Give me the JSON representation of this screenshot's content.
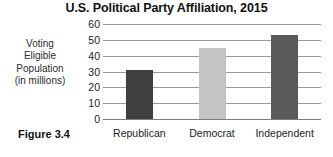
{
  "figure": {
    "caption": "Figure 3.4"
  },
  "chart_data": {
    "type": "bar",
    "title": "U.S. Political Party Affiliation, 2015",
    "xlabel": "",
    "ylabel": "Voting Eligible Population (in millions)",
    "ylabel_lines": [
      "Voting",
      "Eligible",
      "Population",
      "(in millions)"
    ],
    "categories": [
      "Republican",
      "Democrat",
      "Independent"
    ],
    "values": [
      31,
      45,
      53
    ],
    "colors": [
      "#3f3f3f",
      "#c4c4c4",
      "#5a5a5a"
    ],
    "ylim": [
      0,
      60
    ],
    "yticks": [
      60,
      50,
      40,
      30,
      20,
      10,
      0
    ],
    "ytick_labels": [
      "60",
      "50",
      "40",
      "30",
      "20",
      "10",
      "0"
    ],
    "grid": true,
    "grid_axis": "y",
    "legend": false,
    "legend_position": "none",
    "gridline_color": "#9a9a9a",
    "axis_color": "#7d7d7d",
    "background": "#ffffff"
  }
}
